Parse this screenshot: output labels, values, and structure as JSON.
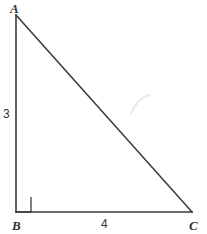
{
  "figure": {
    "kind": "right-triangle-diagram",
    "canvas": {
      "width": 207,
      "height": 234,
      "background": "#ffffff"
    },
    "stroke": {
      "color": "#3a3a3a",
      "width": 1.5
    },
    "vertices": {
      "A": {
        "label": "A",
        "x": 16,
        "y": 15
      },
      "B": {
        "label": "B",
        "x": 16,
        "y": 212
      },
      "C": {
        "label": "C",
        "x": 192,
        "y": 212
      }
    },
    "sides": [
      {
        "name": "leg-ab",
        "from": "A",
        "to": "B",
        "label": "3",
        "orientation": "vertical"
      },
      {
        "name": "leg-bc",
        "from": "B",
        "to": "C",
        "label": "4",
        "orientation": "horizontal"
      },
      {
        "name": "hypotenuse-ac",
        "from": "A",
        "to": "C",
        "label": "",
        "orientation": "diagonal"
      }
    ],
    "right_angle_marker": {
      "at": "B",
      "size": 15,
      "x": 16,
      "y": 197,
      "color": "#4a4a4a"
    },
    "artifact": {
      "name": "scan-smudge",
      "color": "#e8e8e8",
      "x": 130,
      "y": 96
    }
  }
}
